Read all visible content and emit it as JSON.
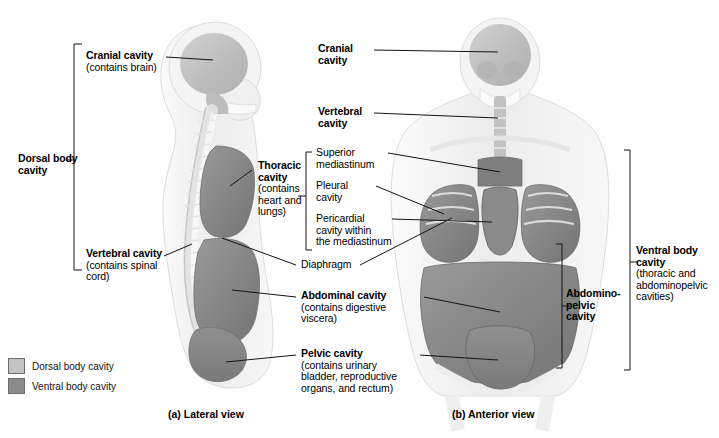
{
  "figure": {
    "background": "#ffffff"
  },
  "colors": {
    "dorsal_cavity": "#c3c3c3",
    "ventral_cavity": "#8b8b8b",
    "body_light": "#e9e9e9",
    "bone": "#f2f2f2",
    "leader": "#1a1a1a",
    "bracket": "#1a1a1a"
  },
  "legend": {
    "items": [
      {
        "label": "Dorsal body cavity",
        "color": "#c3c3c3"
      },
      {
        "label": "Ventral body cavity",
        "color": "#8b8b8b"
      }
    ]
  },
  "captions": {
    "lateral": "(a) Lateral view",
    "anterior": "(b) Anterior view"
  },
  "labels": {
    "dorsal_body_cavity": {
      "title": "Dorsal body",
      "title2": "cavity"
    },
    "cranial_cavity_lateral": {
      "title": "Cranial cavity",
      "sub": "(contains brain)"
    },
    "vertebral_cavity_lateral": {
      "title": "Vertebral cavity",
      "sub": "(contains spinal",
      "sub2": "cord)"
    },
    "thoracic_cavity": {
      "title": "Thoracic",
      "title2": "cavity",
      "sub": "(contains",
      "sub2": "heart and",
      "sub3": "lungs)"
    },
    "diaphragm": {
      "title": "Diaphragm"
    },
    "abdominal_cavity": {
      "title": "Abdominal cavity",
      "sub": "(contains digestive",
      "sub2": "viscera)"
    },
    "pelvic_cavity": {
      "title": "Pelvic cavity",
      "sub": "(contains urinary",
      "sub2": "bladder, reproductive",
      "sub3": "organs, and rectum)"
    },
    "cranial_cavity_anterior": {
      "title": "Cranial",
      "title2": "cavity"
    },
    "vertebral_cavity_anterior": {
      "title": "Vertebral",
      "title2": "cavity"
    },
    "superior_mediastinum": {
      "title": "Superior",
      "title2": "mediastinum"
    },
    "pleural_cavity": {
      "title": "Pleural",
      "title2": "cavity"
    },
    "pericardial_cavity": {
      "title": "Pericardial",
      "title2": "cavity within",
      "title3": "the mediastinum"
    },
    "abdominopelvic_cavity": {
      "title": "Abdomino-",
      "title2": "pelvic",
      "title3": "cavity"
    },
    "ventral_body_cavity": {
      "title": "Ventral body",
      "title2": "cavity",
      "sub": "(thoracic and",
      "sub2": "abdominopelvic",
      "sub3": "cavities)"
    }
  }
}
